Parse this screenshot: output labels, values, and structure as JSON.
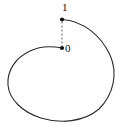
{
  "figure": {
    "title": "",
    "background_color": "#ffffff",
    "stroke_color": "#2b2b2b",
    "labels": {
      "start_point": "1",
      "end_point": "0"
    },
    "points": [
      {
        "name": "point-one",
        "label": "1",
        "x": 62,
        "y": 19.5,
        "radius": 2.1
      },
      {
        "name": "point-zero",
        "label": "0",
        "x": 62,
        "y": 48,
        "radius": 2.1
      }
    ],
    "connector": {
      "name": "dashed-connector",
      "style": "dashed",
      "x1": 62,
      "y1": 21.5,
      "x2": 62,
      "y2": 46,
      "dash_pattern": "2,2",
      "color": "#6f6f6f"
    },
    "curve": {
      "name": "spiral-curve",
      "type": "open-spiral-loop",
      "stroke_width": 1.1,
      "color": "#2b2b2b",
      "path": "M 62 19.5 C 84 21 101 36 110 55 C 118 73 114 94 99 109 C 84 122 60 124 41 118 C 22 112 9 99 8 85 C 7 71 15 58 30 51 C 40 46 52 46 62 48"
    }
  }
}
